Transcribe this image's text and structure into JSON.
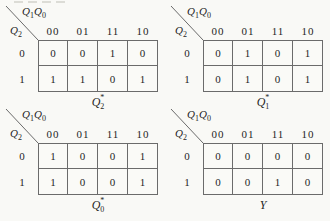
{
  "colors": {
    "background": "#f9f9f6",
    "grid_border": "#6b6b6b",
    "text": "#1f1f1f"
  },
  "kmaps": [
    {
      "corner_top": {
        "base1": "Q",
        "sub1": "1",
        "base2": "Q",
        "sub2": "0"
      },
      "corner_side": {
        "base": "Q",
        "sub": "2"
      },
      "col_headers": [
        "00",
        "01",
        "11",
        "10"
      ],
      "row_headers": [
        "0",
        "1"
      ],
      "rows": [
        [
          "0",
          "0",
          "1",
          "0"
        ],
        [
          "1",
          "1",
          "0",
          "1"
        ]
      ],
      "caption": {
        "base": "Q",
        "sub": "2",
        "sup": "*"
      }
    },
    {
      "corner_top": {
        "base1": "Q",
        "sub1": "1",
        "base2": "Q",
        "sub2": "0"
      },
      "corner_side": {
        "base": "Q",
        "sub": "2"
      },
      "col_headers": [
        "00",
        "01",
        "11",
        "10"
      ],
      "row_headers": [
        "0",
        "1"
      ],
      "rows": [
        [
          "0",
          "1",
          "0",
          "1"
        ],
        [
          "0",
          "1",
          "0",
          "1"
        ]
      ],
      "caption": {
        "base": "Q",
        "sub": "1",
        "sup": "*"
      }
    },
    {
      "corner_top": {
        "base1": "Q",
        "sub1": "1",
        "base2": "Q",
        "sub2": "0"
      },
      "corner_side": {
        "base": "Q",
        "sub": "2"
      },
      "col_headers": [
        "00",
        "01",
        "11",
        "10"
      ],
      "row_headers": [
        "0",
        "1"
      ],
      "rows": [
        [
          "1",
          "0",
          "0",
          "1"
        ],
        [
          "1",
          "0",
          "0",
          "1"
        ]
      ],
      "caption": {
        "base": "Q",
        "sub": "0",
        "sup": "*"
      }
    },
    {
      "corner_top": {
        "base1": "Q",
        "sub1": "1",
        "base2": "Q",
        "sub2": "0"
      },
      "corner_side": {
        "base": "Q",
        "sub": "2"
      },
      "col_headers": [
        "00",
        "01",
        "11",
        "10"
      ],
      "row_headers": [
        "0",
        "1"
      ],
      "rows": [
        [
          "0",
          "0",
          "0",
          "0"
        ],
        [
          "0",
          "0",
          "1",
          "0"
        ]
      ],
      "caption": {
        "base": "Y",
        "sub": "",
        "sup": ""
      }
    }
  ]
}
